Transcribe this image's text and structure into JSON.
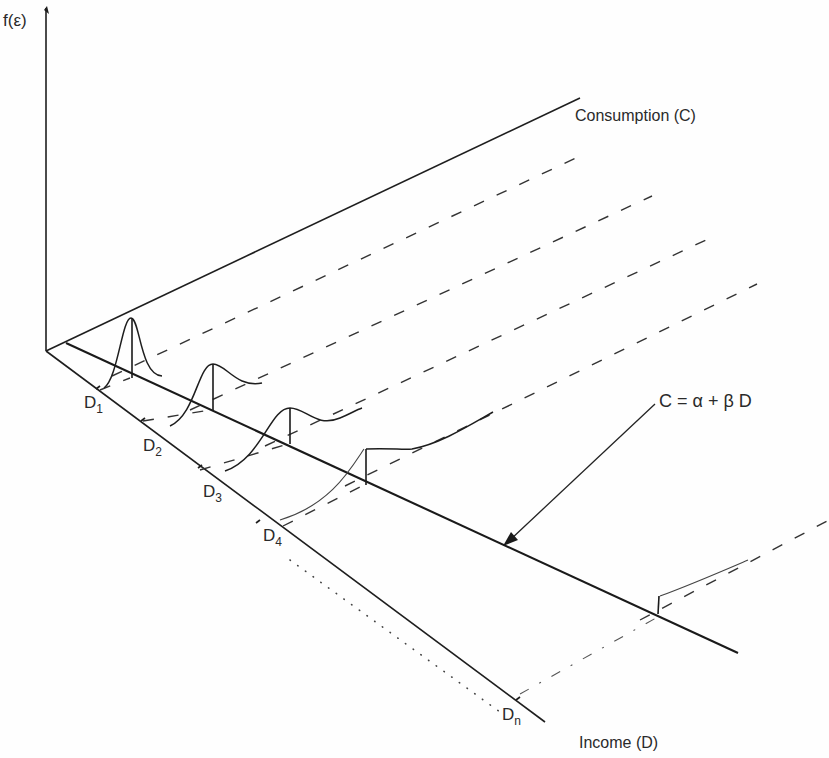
{
  "diagram": {
    "labels": {
      "y_axis": "f(ε)",
      "consumption_axis": "Consumption (C)",
      "income_axis": "Income (D)",
      "equation": "C = α + β D",
      "d1_base": "D",
      "d1_sub": "1",
      "d2_base": "D",
      "d2_sub": "2",
      "d3_base": "D",
      "d3_sub": "3",
      "d4_base": "D",
      "d4_sub": "4",
      "dn_base": "D",
      "dn_sub": "n"
    },
    "geometry": {
      "origin": [
        46,
        351
      ],
      "f_axis_top": [
        46,
        8
      ],
      "consumption_axis_end": [
        580,
        98
      ],
      "income_axis_end": [
        545,
        722
      ],
      "regression_line": [
        [
          66,
          343
        ],
        [
          738,
          653
        ]
      ],
      "income_ticks": [
        [
          96,
          389
        ],
        [
          141,
          421
        ],
        [
          198,
          468
        ],
        [
          256,
          523
        ],
        [
          516,
          700
        ]
      ],
      "distribution_peaks": [
        {
          "at": "D1",
          "base": [
            132,
            378
          ],
          "peak_height": 60
        },
        {
          "at": "D2",
          "base": [
            213,
            410
          ],
          "peak_height": 46
        },
        {
          "at": "D3",
          "base": [
            290,
            444
          ],
          "peak_height": 36
        },
        {
          "at": "D4",
          "base": [
            365,
            484
          ],
          "peak_height": 28
        },
        {
          "at": "Dn",
          "base": [
            658,
            615
          ],
          "peak_height": 18
        }
      ]
    },
    "colors": {
      "ink": "#1e1e1e",
      "background": "#fefefe"
    }
  }
}
